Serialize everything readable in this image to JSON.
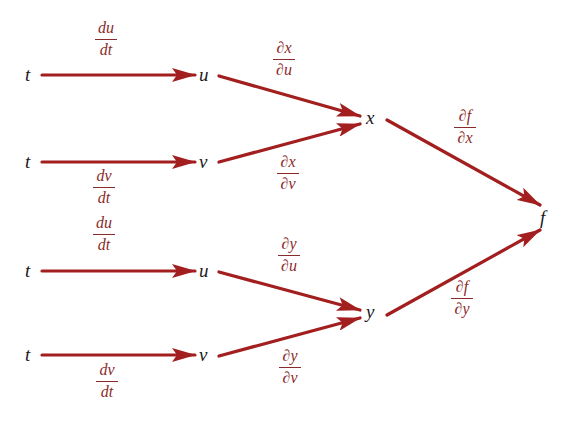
{
  "diagram": {
    "type": "chain-rule-tree",
    "colors": {
      "arrow": "#a31e1e",
      "label": "#8b2a2a",
      "node": "#1a1a1a"
    },
    "nodes": {
      "t1": "t",
      "u1": "u",
      "t2": "t",
      "v1": "v",
      "t3": "t",
      "u2": "u",
      "t4": "t",
      "v2": "v",
      "x": "x",
      "y": "y",
      "f": "f"
    },
    "labels": {
      "du_dt_1": {
        "num": "du",
        "den": "dt"
      },
      "dv_dt_1": {
        "num": "dv",
        "den": "dt"
      },
      "du_dt_2": {
        "num": "du",
        "den": "dt"
      },
      "dv_dt_2": {
        "num": "dv",
        "den": "dt"
      },
      "dx_du": {
        "num": "∂x",
        "den": "∂u"
      },
      "dx_dv": {
        "num": "∂x",
        "den": "∂v"
      },
      "dy_du": {
        "num": "∂y",
        "den": "∂u"
      },
      "dy_dv": {
        "num": "∂y",
        "den": "∂v"
      },
      "df_dx": {
        "num": "∂f",
        "den": "∂x"
      },
      "df_dy": {
        "num": "∂f",
        "den": "∂y"
      }
    },
    "edges": [
      {
        "from": "t1",
        "to": "u1",
        "label": "du/dt"
      },
      {
        "from": "t2",
        "to": "v1",
        "label": "dv/dt"
      },
      {
        "from": "t3",
        "to": "u2",
        "label": "du/dt"
      },
      {
        "from": "t4",
        "to": "v2",
        "label": "dv/dt"
      },
      {
        "from": "u1",
        "to": "x",
        "label": "∂x/∂u"
      },
      {
        "from": "v1",
        "to": "x",
        "label": "∂x/∂v"
      },
      {
        "from": "u2",
        "to": "y",
        "label": "∂y/∂u"
      },
      {
        "from": "v2",
        "to": "y",
        "label": "∂y/∂v"
      },
      {
        "from": "x",
        "to": "f",
        "label": "∂f/∂x"
      },
      {
        "from": "y",
        "to": "f",
        "label": "∂f/∂y"
      }
    ]
  }
}
